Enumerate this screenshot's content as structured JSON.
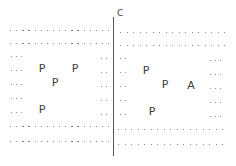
{
  "diagram": {
    "divider": {
      "label": "C",
      "x": 113,
      "y_top": 17,
      "y_bottom": 156,
      "label_x": 117,
      "label_y": 9
    },
    "colors": {
      "dots": "#6a6a6a",
      "text": "#3c3c3c",
      "line": "#555555",
      "background": "#ffffff"
    },
    "regions": [
      {
        "name": "left-region",
        "full_rows": [
          {
            "y": 30,
            "x_start": 10,
            "x_end": 108,
            "count": 17
          },
          {
            "y": 43,
            "x_start": 10,
            "x_end": 108,
            "count": 17
          },
          {
            "y": 126,
            "x_start": 10,
            "x_end": 108,
            "count": 17
          },
          {
            "y": 141,
            "x_start": 10,
            "x_end": 108,
            "count": 17
          }
        ],
        "side_rows": [
          56,
          70,
          84,
          98,
          112
        ],
        "left_side_x": [
          11,
          16,
          21
        ],
        "right_side_x": [
          101,
          106
        ],
        "right_side_rows": [
          58,
          72,
          86,
          100,
          114
        ],
        "letters": [
          {
            "text": "P",
            "x": 42,
            "y": 68
          },
          {
            "text": "P",
            "x": 75,
            "y": 68
          },
          {
            "text": "P",
            "x": 55,
            "y": 82
          },
          {
            "text": "P",
            "x": 42,
            "y": 109
          }
        ]
      },
      {
        "name": "right-region",
        "full_rows": [
          {
            "y": 32,
            "x_start": 120,
            "x_end": 224,
            "count": 17
          },
          {
            "y": 45,
            "x_start": 120,
            "x_end": 224,
            "count": 17
          },
          {
            "y": 129,
            "x_start": 118,
            "x_end": 222,
            "count": 17
          },
          {
            "y": 144,
            "x_start": 118,
            "x_end": 222,
            "count": 17
          }
        ],
        "side_rows": [
          58,
          72,
          86,
          100,
          114
        ],
        "left_side_x": [
          120,
          125
        ],
        "right_side_x": [
          210,
          215,
          220
        ],
        "right_side_rows": [
          60,
          74,
          88,
          102,
          116
        ],
        "letters": [
          {
            "text": "P",
            "x": 146,
            "y": 70
          },
          {
            "text": "P",
            "x": 165,
            "y": 84
          },
          {
            "text": "A",
            "x": 191,
            "y": 85
          },
          {
            "text": "P",
            "x": 152,
            "y": 111
          }
        ]
      }
    ]
  }
}
